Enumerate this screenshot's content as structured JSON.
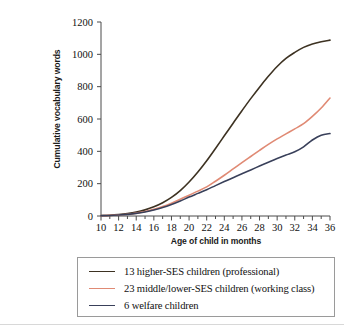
{
  "chart_data": {
    "type": "line",
    "title": "",
    "xlabel": "Age of child in months",
    "ylabel": "Cumulative vocabulary words",
    "xlim": [
      10,
      36
    ],
    "ylim": [
      0,
      1200
    ],
    "xticks": [
      10,
      12,
      14,
      16,
      18,
      20,
      22,
      24,
      26,
      28,
      30,
      32,
      34,
      36
    ],
    "xtick_labels": [
      "10",
      "12",
      "14",
      "16",
      "18",
      "20",
      "22",
      "24",
      "26",
      "28",
      "30",
      "32",
      "34",
      "36"
    ],
    "xminor_step": 1,
    "yticks": [
      0,
      200,
      400,
      600,
      800,
      1000,
      1200
    ],
    "ytick_labels": [
      "0",
      "200",
      "400",
      "600",
      "800",
      "1000",
      "1200"
    ],
    "grid": false,
    "legend_position": "below-axes",
    "x": [
      10,
      11,
      12,
      13,
      14,
      15,
      16,
      17,
      18,
      19,
      20,
      21,
      22,
      23,
      24,
      25,
      26,
      27,
      28,
      29,
      30,
      31,
      32,
      33,
      34,
      35,
      36
    ],
    "series": [
      {
        "name": "13 higher-SES children (professional)",
        "color": "#3d3222",
        "values": [
          3,
          5,
          9,
          15,
          24,
          38,
          57,
          82,
          115,
          157,
          210,
          272,
          342,
          418,
          496,
          574,
          651,
          726,
          797,
          864,
          925,
          975,
          1012,
          1043,
          1064,
          1078,
          1088
        ]
      },
      {
        "name": "23 middle/lower-SES children (working class)",
        "color": "#e08a74",
        "values": [
          2,
          4,
          7,
          11,
          18,
          28,
          41,
          58,
          79,
          103,
          129,
          154,
          180,
          215,
          252,
          291,
          330,
          368,
          406,
          443,
          477,
          508,
          539,
          571,
          616,
          668,
          730
        ]
      },
      {
        "name": "6 welfare children",
        "color": "#39405a",
        "values": [
          2,
          3,
          6,
          10,
          16,
          25,
          37,
          52,
          71,
          93,
          117,
          140,
          163,
          188,
          213,
          237,
          261,
          285,
          309,
          333,
          356,
          377,
          397,
          428,
          470,
          500,
          510
        ]
      }
    ]
  },
  "legend": {
    "entries": [
      {
        "label": "13 higher-SES children (professional)",
        "color": "#3d3222"
      },
      {
        "label": "23 middle/lower-SES children (working class)",
        "color": "#e08a74"
      },
      {
        "label": "6 welfare children",
        "color": "#39405a"
      }
    ]
  }
}
